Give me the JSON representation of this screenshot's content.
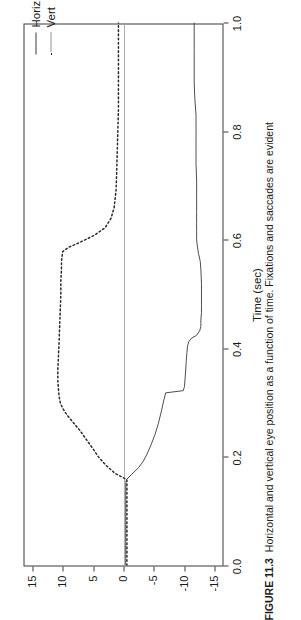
{
  "figure": {
    "caption_label": "FIGURE 11.3",
    "caption_text": "Horizontal and vertical eye position as a function of time. Fixations and saccades are evident",
    "rotation_deg": -90
  },
  "legend": {
    "position": "top-right-outside",
    "items": [
      {
        "label": "Horiz",
        "style": "solid",
        "color": "#3a3a3a"
      },
      {
        "label": "Vert",
        "style": "dotted",
        "color": "#2a2a2a"
      }
    ]
  },
  "chart_data": {
    "type": "line",
    "title": "",
    "xlabel": "Time (sec)",
    "ylabel": "Degrees",
    "xlim": [
      0.0,
      1.0
    ],
    "ylim": [
      -16.5,
      16.5
    ],
    "grid": false,
    "xticks": [
      0.0,
      0.2,
      0.4,
      0.6,
      0.8,
      1.0
    ],
    "xticklabels": [
      "0.0",
      "0.2",
      "0.4",
      "0.6",
      "0.8",
      "1.0"
    ],
    "yticks": [
      15,
      10,
      5,
      0,
      -5,
      -10,
      -15
    ],
    "yticklabels": [
      "15",
      "10",
      "5",
      "0",
      "-5",
      "-10",
      "-15"
    ],
    "series": [
      {
        "name": "Horiz",
        "style": "solid",
        "color": "#3a3a3a",
        "x": [
          0.0,
          0.02,
          0.04,
          0.06,
          0.08,
          0.1,
          0.12,
          0.14,
          0.15,
          0.158,
          0.168,
          0.18,
          0.192,
          0.205,
          0.22,
          0.24,
          0.262,
          0.285,
          0.305,
          0.318,
          0.322,
          0.33,
          0.345,
          0.36,
          0.378,
          0.392,
          0.404,
          0.412,
          0.418,
          0.424,
          0.432,
          0.44,
          0.452,
          0.466,
          0.48,
          0.5,
          0.52,
          0.545,
          0.56,
          0.575,
          0.59,
          0.6,
          0.615,
          0.63,
          0.65,
          0.68,
          0.71,
          0.74,
          0.77,
          0.8,
          0.83,
          0.86,
          0.89,
          0.92,
          0.95,
          0.975,
          1.0
        ],
        "y": [
          -0.2,
          -0.2,
          -0.2,
          -0.2,
          -0.2,
          -0.2,
          -0.2,
          -0.2,
          -0.2,
          -0.3,
          -1.2,
          -2.3,
          -3.1,
          -3.7,
          -4.3,
          -5.0,
          -5.6,
          -6.1,
          -6.5,
          -6.8,
          -9.7,
          -9.9,
          -10.0,
          -10.1,
          -10.2,
          -10.3,
          -10.4,
          -10.6,
          -11.0,
          -11.9,
          -12.4,
          -12.6,
          -12.6,
          -12.7,
          -12.7,
          -12.7,
          -12.7,
          -12.6,
          -12.5,
          -12.2,
          -12.0,
          -11.9,
          -11.9,
          -11.9,
          -11.9,
          -11.9,
          -11.9,
          -11.8,
          -11.8,
          -11.8,
          -11.8,
          -11.6,
          -11.5,
          -11.5,
          -11.5,
          -11.5,
          -11.5
        ]
      },
      {
        "name": "Vert",
        "style": "dotted",
        "color": "#2a2a2a",
        "x": [
          0.0,
          0.02,
          0.04,
          0.06,
          0.08,
          0.1,
          0.12,
          0.14,
          0.15,
          0.158,
          0.17,
          0.185,
          0.2,
          0.215,
          0.232,
          0.248,
          0.26,
          0.272,
          0.282,
          0.292,
          0.3,
          0.312,
          0.325,
          0.34,
          0.36,
          0.385,
          0.41,
          0.44,
          0.47,
          0.5,
          0.525,
          0.545,
          0.56,
          0.57,
          0.578,
          0.586,
          0.596,
          0.608,
          0.622,
          0.64,
          0.66,
          0.69,
          0.72,
          0.76,
          0.8,
          0.84,
          0.88,
          0.92,
          0.96,
          1.0
        ],
        "y": [
          -0.4,
          -0.4,
          -0.4,
          -0.4,
          -0.4,
          -0.4,
          -0.4,
          -0.4,
          -0.4,
          -0.4,
          1.6,
          3.1,
          4.3,
          5.2,
          6.3,
          7.3,
          8.2,
          9.1,
          9.8,
          10.3,
          10.6,
          10.8,
          10.9,
          11.0,
          11.0,
          10.9,
          10.8,
          10.7,
          10.6,
          10.5,
          10.5,
          10.4,
          10.4,
          10.3,
          10.2,
          9.2,
          7.2,
          5.0,
          3.2,
          2.2,
          1.7,
          1.4,
          1.3,
          1.2,
          1.1,
          1.0,
          1.0,
          1.0,
          1.0,
          1.0
        ]
      },
      {
        "name": "zero-reference",
        "style": "solid-thin",
        "color": "#9a9a9a",
        "x": [
          0.0,
          1.0
        ],
        "y": [
          0.0,
          0.0
        ]
      }
    ]
  }
}
